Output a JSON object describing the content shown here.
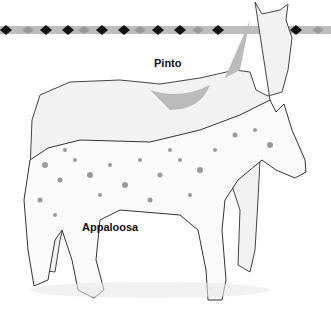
{
  "labels": {
    "pinto": "Pinto",
    "appaloosa": "Appaloosa"
  },
  "colors": {
    "band_dark": "#111111",
    "band_mid": "#8a8a8a",
    "band_light": "#e6e6e6",
    "ink": "#333333",
    "shade": "#9a9a9a"
  }
}
